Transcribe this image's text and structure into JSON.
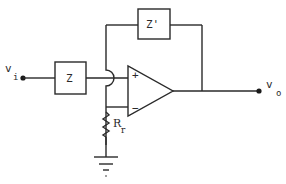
{
  "diagram": {
    "type": "op-amp circuit schematic",
    "input": {
      "label": "v",
      "subscript": "i"
    },
    "output": {
      "label": "v",
      "subscript": "o"
    },
    "input_impedance": {
      "label": "Z"
    },
    "feedback_impedance": {
      "label": "Z'"
    },
    "resistor": {
      "label": "R",
      "subscript": "r"
    },
    "opamp": {
      "plus_label": "+",
      "minus_label": "−"
    },
    "ground": {
      "name": "ground"
    }
  }
}
